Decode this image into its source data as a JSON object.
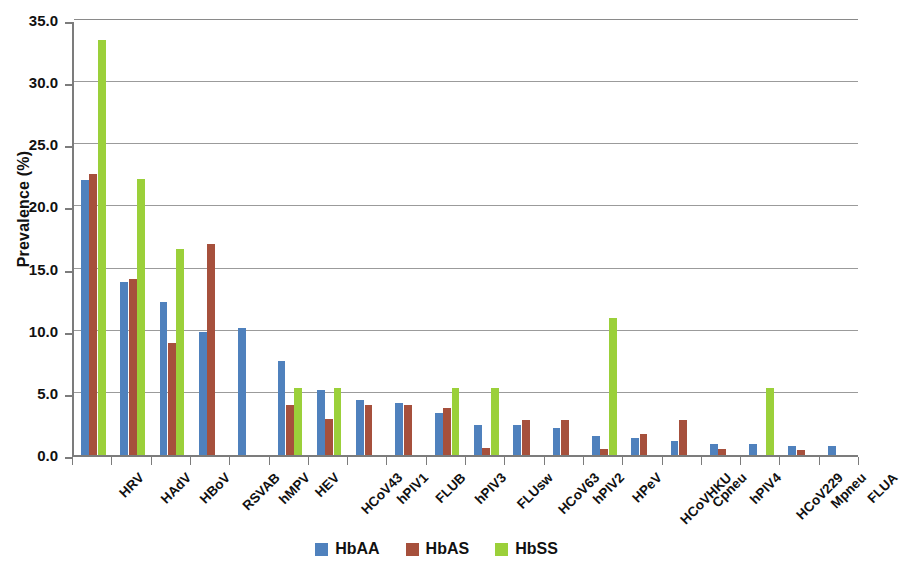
{
  "chart_data": {
    "type": "bar",
    "title": "",
    "xlabel": "",
    "ylabel": "Prevalence (%)",
    "ylim": [
      0,
      35
    ],
    "ytick_labels": [
      "0.0",
      "5.0",
      "10.0",
      "15.0",
      "20.0",
      "25.0",
      "30.0",
      "35.0"
    ],
    "ytick_values": [
      0,
      5,
      10,
      15,
      20,
      25,
      30,
      35
    ],
    "grid": true,
    "legend_position": "bottom",
    "categories": [
      "HRV",
      "HAdV",
      "HBoV",
      "RSVAB",
      "hMPV",
      "HEV",
      "HCoV43",
      "hPIV1",
      "FLUB",
      "hPIV3",
      "FLUsw",
      "HCoV63",
      "hPIV2",
      "HPeV",
      "HCoVHKU",
      "Cpneu",
      "hPIV4",
      "HCoV229",
      "Mpneu",
      "FLUA"
    ],
    "series": [
      {
        "name": "HbAA",
        "color": "#4f81bd",
        "values": [
          22.1,
          13.9,
          12.3,
          9.9,
          10.2,
          7.6,
          5.2,
          4.4,
          4.2,
          3.4,
          2.4,
          2.4,
          2.2,
          1.5,
          1.4,
          1.1,
          0.9,
          0.9,
          0.7,
          0.7
        ]
      },
      {
        "name": "HbAS",
        "color": "#a6503c",
        "values": [
          22.6,
          14.2,
          9.0,
          17.0,
          0,
          4.0,
          2.9,
          4.0,
          4.0,
          3.8,
          0.6,
          2.8,
          2.8,
          0.5,
          1.7,
          2.8,
          0.5,
          0,
          0.4,
          0
        ]
      },
      {
        "name": "HbSS",
        "color": "#9bd03a",
        "values": [
          33.4,
          22.2,
          16.6,
          0,
          0,
          5.4,
          5.4,
          0,
          0,
          5.4,
          5.4,
          0,
          0,
          11.0,
          0,
          0,
          0,
          5.4,
          0,
          0
        ]
      }
    ]
  },
  "axis": {
    "y_title": "Prevalence (%)"
  },
  "legend": {
    "items": [
      {
        "label": "HbAA",
        "color": "#4f81bd"
      },
      {
        "label": "HbAS",
        "color": "#a6503c"
      },
      {
        "label": "HbSS",
        "color": "#9bd03a"
      }
    ]
  }
}
